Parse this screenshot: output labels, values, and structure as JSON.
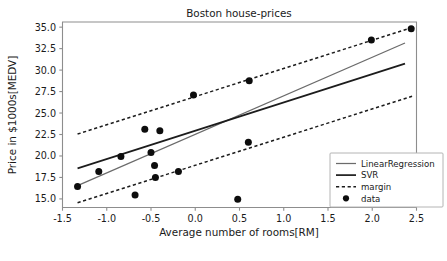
{
  "chart_data": {
    "type": "scatter",
    "title": "Boston house-prices",
    "xlabel": "Average number of rooms[RM]",
    "ylabel": "Price in $1000s[MEDV]",
    "xlim": [
      -1.5,
      2.5
    ],
    "ylim": [
      14.0,
      35.6
    ],
    "xticks": [
      -1.5,
      -1.0,
      -0.5,
      0.0,
      0.5,
      1.0,
      1.5,
      2.0,
      2.5
    ],
    "xtick_labels": [
      "-1.5",
      "-1.0",
      "-0.5",
      "0.0",
      "0.5",
      "1.0",
      "1.5",
      "2.0",
      "2.5"
    ],
    "yticks": [
      15.0,
      17.5,
      20.0,
      22.5,
      25.0,
      27.5,
      30.0,
      32.5,
      35.0
    ],
    "ytick_labels": [
      "15.0",
      "17.5",
      "20.0",
      "22.5",
      "25.0",
      "27.5",
      "30.0",
      "32.5",
      "35.0"
    ],
    "grid": false,
    "legend_position": "lower right",
    "series": [
      {
        "name": "LinearRegression",
        "type": "line",
        "color": "#6b6b6b",
        "style": "solid",
        "points": [
          [
            -1.33,
            16.55
          ],
          [
            2.37,
            33.15
          ]
        ]
      },
      {
        "name": "SVR",
        "type": "line",
        "color": "#1c1c1c",
        "style": "solid",
        "points": [
          [
            -1.33,
            18.55
          ],
          [
            2.37,
            30.75
          ]
        ]
      },
      {
        "name": "margin",
        "type": "line",
        "color": "#1c1c1c",
        "style": "dashed",
        "upper": [
          [
            -1.33,
            22.55
          ],
          [
            2.45,
            34.95
          ]
        ],
        "lower": [
          [
            -1.33,
            14.55
          ],
          [
            2.45,
            26.95
          ]
        ]
      },
      {
        "name": "data",
        "type": "scatter",
        "color": "#0d0d0d",
        "marker": "circle",
        "points": [
          [
            -1.33,
            16.45
          ],
          [
            -1.09,
            18.2
          ],
          [
            -0.84,
            19.95
          ],
          [
            -0.68,
            15.45
          ],
          [
            -0.57,
            23.1
          ],
          [
            -0.5,
            20.4
          ],
          [
            -0.46,
            18.9
          ],
          [
            -0.45,
            17.5
          ],
          [
            -0.4,
            22.95
          ],
          [
            -0.19,
            18.2
          ],
          [
            -0.02,
            27.1
          ],
          [
            0.48,
            14.95
          ],
          [
            0.6,
            21.6
          ],
          [
            0.61,
            28.75
          ],
          [
            1.99,
            33.5
          ],
          [
            2.44,
            34.8
          ]
        ]
      }
    ],
    "legend_entries": [
      {
        "label": "LinearRegression",
        "kind": "line-thin"
      },
      {
        "label": "SVR",
        "kind": "line-thick"
      },
      {
        "label": "margin",
        "kind": "line-dashed"
      },
      {
        "label": "data",
        "kind": "marker-dot"
      }
    ]
  }
}
